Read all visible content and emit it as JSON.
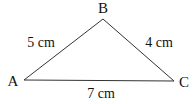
{
  "diagram": {
    "type": "triangle",
    "vertices": {
      "A": {
        "label": "A"
      },
      "B": {
        "label": "B"
      },
      "C": {
        "label": "C"
      }
    },
    "sides": {
      "AB": {
        "label": "5 cm"
      },
      "BC": {
        "label": "4 cm"
      },
      "AC": {
        "label": "7 cm"
      }
    },
    "line_color": "#333333"
  }
}
